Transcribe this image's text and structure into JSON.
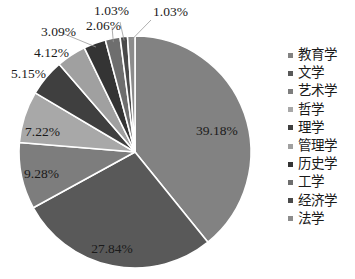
{
  "chart_data": {
    "type": "pie",
    "title": "",
    "legend_position": "right",
    "categories": [
      "教育学",
      "文学",
      "艺术学",
      "哲学",
      "理学",
      "管理学",
      "历史学",
      "工学",
      "经济学",
      "法学"
    ],
    "values": [
      39.18,
      27.84,
      9.28,
      7.22,
      5.15,
      4.12,
      3.09,
      2.06,
      1.03,
      1.03
    ],
    "value_labels": [
      "39.18%",
      "27.84%",
      "9.28%",
      "7.22%",
      "5.15%",
      "4.12%",
      "3.09%",
      "2.06%",
      "1.03%",
      "1.03%"
    ],
    "unit": "%",
    "colors": [
      "#828282",
      "#595959",
      "#7d7d7d",
      "#a8a8a8",
      "#3f3f3f",
      "#a0a0a0",
      "#343434",
      "#6e6e6e",
      "#4a4a4a",
      "#8c8c8c"
    ],
    "slice_border_color": "#ffffff",
    "background": "#ffffff",
    "start_angle_deg": 0,
    "direction": "clockwise"
  },
  "legend": {
    "items": [
      {
        "label": "教育学",
        "color": "#828282"
      },
      {
        "label": "文学",
        "color": "#595959"
      },
      {
        "label": "艺术学",
        "color": "#7d7d7d"
      },
      {
        "label": "哲学",
        "color": "#a8a8a8"
      },
      {
        "label": "理学",
        "color": "#3f3f3f"
      },
      {
        "label": "管理学",
        "color": "#a0a0a0"
      },
      {
        "label": "历史学",
        "color": "#343434"
      },
      {
        "label": "工学",
        "color": "#6e6e6e"
      },
      {
        "label": "经济学",
        "color": "#4a4a4a"
      },
      {
        "label": "法学",
        "color": "#8c8c8c"
      }
    ]
  },
  "labels": {
    "l0": "39.18%",
    "l1": "27.84%",
    "l2": "9.28%",
    "l3": "7.22%",
    "l4": "5.15%",
    "l5": "4.12%",
    "l6": "3.09%",
    "l7": "2.06%",
    "l8": "1.03%",
    "l9": "1.03%"
  }
}
